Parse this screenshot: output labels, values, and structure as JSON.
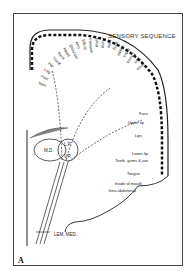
{
  "diagram": {
    "title": "SENSORY SEQUENCE",
    "panel_label": "A",
    "arc_labels": [
      "Toes",
      "Foot",
      "Leg",
      "Hip",
      "Trunk",
      "Neck",
      "Head",
      "Shoulder",
      "Arm",
      "Elbow",
      "Forearm",
      "Wrist",
      "Hand",
      "Little",
      "Ring",
      "Middle",
      "Index",
      "Thumb",
      "Eye",
      "Nose"
    ],
    "side_labels": [
      "Face",
      "Upper lip",
      "Lips",
      "Lower lip",
      "Teeth, gums & jaw",
      "Tongue",
      "Inside of mouth",
      "Intra abdominal"
    ],
    "thalamus_labels": {
      "md": "M.D.",
      "lp": "L.P.",
      "vp": "V.P."
    },
    "tract_label": "LEM. MED."
  }
}
